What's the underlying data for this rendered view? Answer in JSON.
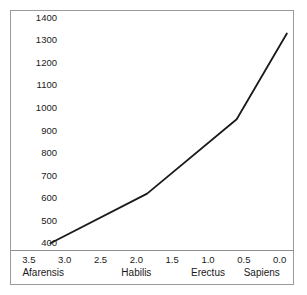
{
  "chart_data": {
    "type": "line",
    "title": "",
    "subtitle": "",
    "xlabel": "",
    "ylabel": "",
    "x_tick_labels": [
      "3.5",
      "3.0",
      "2.5",
      "2.0",
      "1.5",
      "1.0",
      "0.5",
      "0.0"
    ],
    "x_tick_values": [
      3.5,
      3.0,
      2.5,
      2.0,
      1.5,
      1.0,
      0.5,
      0.0
    ],
    "category_labels": [
      "Afarensis",
      "Habilis",
      "Erectus",
      "Sapiens"
    ],
    "category_x_values": [
      3.3,
      2.0,
      1.0,
      0.25
    ],
    "y_tick_labels": [
      "1400",
      "1300",
      "1200",
      "1100",
      "1000",
      "900",
      "800",
      "700",
      "600",
      "500",
      "400"
    ],
    "y_tick_values": [
      1400,
      1300,
      1200,
      1100,
      1000,
      900,
      800,
      700,
      600,
      500,
      400
    ],
    "xlim": [
      3.75,
      -0.2
    ],
    "ylim": [
      370,
      1430
    ],
    "x_axis_inverted": true,
    "grid": false,
    "legend": false,
    "series": [
      {
        "name": "Cranial capacity",
        "color": "#1a1a1a",
        "line_width": 1.8,
        "points": [
          {
            "x": 3.2,
            "y": 400,
            "label": "Afarensis"
          },
          {
            "x": 1.85,
            "y": 620,
            "label": "Habilis"
          },
          {
            "x": 0.6,
            "y": 950,
            "label": "Erectus"
          },
          {
            "x": -0.1,
            "y": 1330,
            "label": "Sapiens"
          }
        ]
      }
    ]
  },
  "colors": {
    "line": "#1a1a1a",
    "frame": "#9a9a9a",
    "axis_rule": "#8d8d8d",
    "text": "#1a1a1a",
    "background": "#ffffff"
  }
}
